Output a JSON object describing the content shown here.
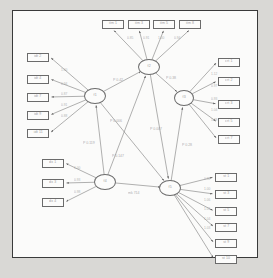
{
  "figure": {
    "kind": "sem-path-diagram",
    "frame_color": "#3a3a3a",
    "canvas_color": "#fbfbfa",
    "page_color": "#d9d8d5",
    "node_stroke": "#6b6b6b",
    "edge_color": "#6f6f6f",
    "label_color": "#9a9a9a"
  },
  "latents": [
    {
      "id": "f1",
      "label": "f1",
      "x": 95,
      "y": 96,
      "rx": 11,
      "ry": 8
    },
    {
      "id": "f2",
      "label": "f2",
      "x": 149,
      "y": 67,
      "rx": 11,
      "ry": 8
    },
    {
      "id": "f3",
      "label": "f3",
      "x": 184,
      "y": 98,
      "rx": 10,
      "ry": 8
    },
    {
      "id": "f4",
      "label": "f4",
      "x": 105,
      "y": 182,
      "rx": 11,
      "ry": 8
    },
    {
      "id": "f5",
      "label": "f5",
      "x": 170,
      "y": 188,
      "rx": 11,
      "ry": 8
    }
  ],
  "indicators": {
    "top": [
      {
        "id": "t1",
        "label": "itm 1",
        "x": 113,
        "y": 24
      },
      {
        "id": "t2",
        "label": "itm 3",
        "x": 139,
        "y": 24
      },
      {
        "id": "t3",
        "label": "itm 5",
        "x": 164,
        "y": 24
      },
      {
        "id": "t4",
        "label": "itm 8",
        "x": 190,
        "y": 24
      }
    ],
    "left": [
      {
        "id": "l1",
        "label": "idt 2",
        "x": 38,
        "y": 57
      },
      {
        "id": "l2",
        "label": "idt 4",
        "x": 38,
        "y": 79
      },
      {
        "id": "l3",
        "label": "idt 7",
        "x": 38,
        "y": 97
      },
      {
        "id": "l4",
        "label": "idt 9",
        "x": 38,
        "y": 115
      },
      {
        "id": "l5",
        "label": "idt 11",
        "x": 38,
        "y": 133
      }
    ],
    "right": [
      {
        "id": "r1",
        "label": "crt 1",
        "x": 229,
        "y": 62
      },
      {
        "id": "r2",
        "label": "crt 2",
        "x": 229,
        "y": 81
      },
      {
        "id": "r3",
        "label": "crt 3",
        "x": 229,
        "y": 104
      },
      {
        "id": "r4",
        "label": "crt 5",
        "x": 229,
        "y": 122
      },
      {
        "id": "r5",
        "label": "crt 7",
        "x": 229,
        "y": 139
      }
    ],
    "bottomleft": [
      {
        "id": "b1",
        "label": "dx 1",
        "x": 53,
        "y": 163
      },
      {
        "id": "b2",
        "label": "dx 3",
        "x": 53,
        "y": 183
      },
      {
        "id": "b3",
        "label": "dx 4",
        "x": 53,
        "y": 202
      }
    ],
    "bottomright": [
      {
        "id": "q1",
        "label": "st 1",
        "x": 226,
        "y": 177
      },
      {
        "id": "q2",
        "label": "st 3",
        "x": 226,
        "y": 194
      },
      {
        "id": "q3",
        "label": "st 5",
        "x": 226,
        "y": 211
      },
      {
        "id": "q4",
        "label": "st 7",
        "x": 226,
        "y": 227
      },
      {
        "id": "q5",
        "label": "st 9",
        "x": 226,
        "y": 243
      },
      {
        "id": "q6",
        "label": "st 10",
        "x": 226,
        "y": 259
      }
    ]
  },
  "loadings": {
    "top": [
      "0.85",
      "0.91",
      "1.00",
      "0.94"
    ],
    "left": [
      "1.00",
      "0.94",
      "0.87",
      "0.91",
      "0.88"
    ],
    "right": [
      "1.12",
      "0.97",
      "0.93",
      "1.04",
      "1.09"
    ],
    "bottomleft": [
      "1.00",
      "0.93",
      "0.98"
    ],
    "bottomright": [
      "0.92",
      "1.00",
      "1.06",
      "1.01",
      "1.04",
      "1.03"
    ]
  },
  "paths": [
    {
      "id": "p1",
      "from": "f1",
      "to": "f2",
      "label": "P 0.42",
      "x": 113,
      "y": 80
    },
    {
      "id": "p2",
      "from": "f2",
      "to": "f3",
      "label": "P 0.38",
      "x": 166,
      "y": 78
    },
    {
      "id": "p3",
      "from": "f4",
      "to": "f1",
      "label": "P 0.119",
      "x": 83,
      "y": 143
    },
    {
      "id": "p4",
      "from": "f4",
      "to": "f2",
      "label": "P 0.147",
      "x": 112,
      "y": 156
    },
    {
      "id": "p5",
      "from": "f1",
      "to": "f5",
      "label": "P 0.006",
      "x": 110,
      "y": 121
    },
    {
      "id": "p6",
      "from": "f2",
      "to": "f5",
      "label": "P 0.007",
      "x": 150,
      "y": 129
    },
    {
      "id": "p7",
      "from": "f5",
      "to": "f3",
      "label": "P 0.28",
      "x": 182,
      "y": 145
    },
    {
      "id": "p8",
      "from": "f4",
      "to": "f5",
      "label": "mk 714",
      "x": 128,
      "y": 193
    }
  ]
}
